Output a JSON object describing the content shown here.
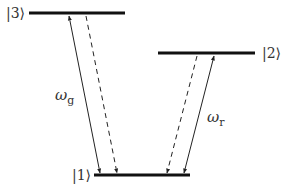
{
  "diagram": {
    "type": "energy-level-diagram",
    "levels": [
      {
        "id": "3",
        "label": "|3⟩",
        "x1": 29,
        "x2": 125,
        "y": 13,
        "label_side": "left"
      },
      {
        "id": "2",
        "label": "|2⟩",
        "x1": 158,
        "x2": 255,
        "y": 53,
        "label_side": "right"
      },
      {
        "id": "1",
        "label": "|1⟩",
        "x1": 94,
        "x2": 190,
        "y": 175,
        "label_side": "left"
      }
    ],
    "transitions": [
      {
        "from": "1",
        "to": "3",
        "style": "solid",
        "heads": "both",
        "label": "ω",
        "subscript": "g"
      },
      {
        "from": "3",
        "to": "1",
        "style": "dashed",
        "heads": "end",
        "label": ""
      },
      {
        "from": "2",
        "to": "1",
        "style": "dashed",
        "heads": "end",
        "label": ""
      },
      {
        "from": "1",
        "to": "2",
        "style": "solid",
        "heads": "both",
        "label": "ω",
        "subscript": "r"
      }
    ],
    "colors": {
      "level_line": "#111111",
      "arrow": "#222222",
      "text": "#333333",
      "background": "#ffffff"
    }
  }
}
